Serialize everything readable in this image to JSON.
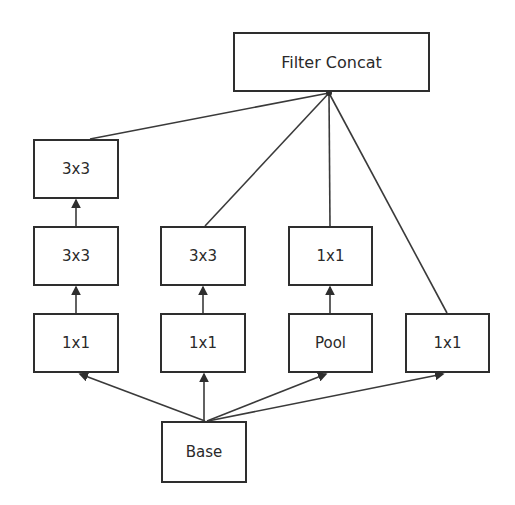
{
  "diagram": {
    "type": "inception-module",
    "colors": {
      "stroke": "#2e2e2e",
      "text": "#2a2a2a",
      "background": "#ffffff"
    },
    "nodes": [
      {
        "id": "concat",
        "label": "Filter Concat",
        "x": 233,
        "y": 32,
        "w": 197,
        "h": 60
      },
      {
        "id": "c1_3x3b",
        "label": "3x3",
        "x": 33,
        "y": 139,
        "w": 86,
        "h": 60
      },
      {
        "id": "c1_3x3a",
        "label": "3x3",
        "x": 33,
        "y": 226,
        "w": 86,
        "h": 60
      },
      {
        "id": "c1_1x1",
        "label": "1x1",
        "x": 33,
        "y": 313,
        "w": 86,
        "h": 60
      },
      {
        "id": "c2_3x3",
        "label": "3x3",
        "x": 160,
        "y": 226,
        "w": 86,
        "h": 60
      },
      {
        "id": "c2_1x1",
        "label": "1x1",
        "x": 160,
        "y": 313,
        "w": 86,
        "h": 60
      },
      {
        "id": "c3_1x1",
        "label": "1x1",
        "x": 288,
        "y": 226,
        "w": 85,
        "h": 60
      },
      {
        "id": "c3_pool",
        "label": "Pool",
        "x": 288,
        "y": 313,
        "w": 85,
        "h": 60
      },
      {
        "id": "c4_1x1",
        "label": "1x1",
        "x": 405,
        "y": 313,
        "w": 85,
        "h": 60
      },
      {
        "id": "base",
        "label": "Base",
        "x": 161,
        "y": 421,
        "w": 86,
        "h": 62
      }
    ],
    "edges": [
      {
        "from": "base",
        "to": "c1_1x1"
      },
      {
        "from": "base",
        "to": "c2_1x1"
      },
      {
        "from": "base",
        "to": "c3_pool"
      },
      {
        "from": "base",
        "to": "c4_1x1"
      },
      {
        "from": "c1_1x1",
        "to": "c1_3x3a"
      },
      {
        "from": "c1_3x3a",
        "to": "c1_3x3b"
      },
      {
        "from": "c2_1x1",
        "to": "c2_3x3"
      },
      {
        "from": "c3_pool",
        "to": "c3_1x1"
      },
      {
        "from": "c1_3x3b",
        "to": "concat"
      },
      {
        "from": "c2_3x3",
        "to": "concat"
      },
      {
        "from": "c3_1x1",
        "to": "concat"
      },
      {
        "from": "c4_1x1",
        "to": "concat"
      }
    ]
  }
}
